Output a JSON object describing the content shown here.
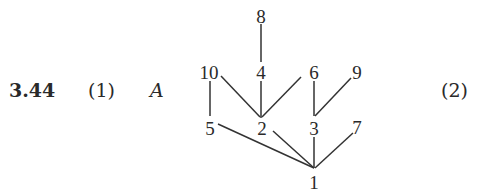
{
  "problem": {
    "number": "3.44",
    "part1": "(1)",
    "var": "A",
    "part2": "(2)"
  },
  "diagram": {
    "type": "hasse",
    "nodes": [
      {
        "id": "1",
        "label": "1",
        "x": 314,
        "y": 184
      },
      {
        "id": "2",
        "label": "2",
        "x": 262,
        "y": 128
      },
      {
        "id": "3",
        "label": "3",
        "x": 314,
        "y": 128
      },
      {
        "id": "5",
        "label": "5",
        "x": 210,
        "y": 128
      },
      {
        "id": "7",
        "label": "7",
        "x": 357,
        "y": 128
      },
      {
        "id": "4",
        "label": "4",
        "x": 261,
        "y": 72
      },
      {
        "id": "6",
        "label": "6",
        "x": 314,
        "y": 72
      },
      {
        "id": "9",
        "label": "9",
        "x": 357,
        "y": 72
      },
      {
        "id": "10",
        "label": "10",
        "x": 209,
        "y": 72
      },
      {
        "id": "8",
        "label": "8",
        "x": 261,
        "y": 16
      }
    ],
    "edges": [
      [
        "8",
        "4"
      ],
      [
        "4",
        "2"
      ],
      [
        "10",
        "2"
      ],
      [
        "6",
        "2"
      ],
      [
        "10",
        "5"
      ],
      [
        "6",
        "3"
      ],
      [
        "9",
        "3"
      ],
      [
        "5",
        "1"
      ],
      [
        "2",
        "1"
      ],
      [
        "3",
        "1"
      ],
      [
        "7",
        "1"
      ]
    ]
  }
}
